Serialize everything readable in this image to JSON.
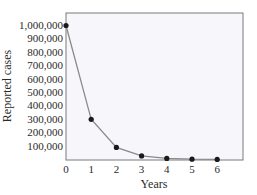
{
  "chart_data": {
    "type": "line",
    "title": "",
    "xlabel": "Years",
    "ylabel": "Reported cases",
    "x": [
      0,
      1,
      2,
      3,
      4,
      5,
      6
    ],
    "series": [
      {
        "name": "Reported cases",
        "values": [
          1000000,
          300000,
          90000,
          27000,
          8100,
          2430,
          729
        ]
      }
    ],
    "xticks": [
      "0",
      "1",
      "2",
      "3",
      "4",
      "5",
      "6"
    ],
    "yticks": [
      "100,000",
      "200,000",
      "300,000",
      "400,000",
      "500,000",
      "600,000",
      "700,000",
      "800,000",
      "900,000",
      "1,000,000"
    ],
    "xlim": [
      0,
      7
    ],
    "ylim": [
      0,
      1100000
    ],
    "grid": false,
    "legend": "none",
    "colors": {
      "line": "#8a8a8a",
      "marker": "#1a1a1a",
      "plot_bg": "#f7f7fb",
      "frame": "#7a7a7a"
    }
  }
}
